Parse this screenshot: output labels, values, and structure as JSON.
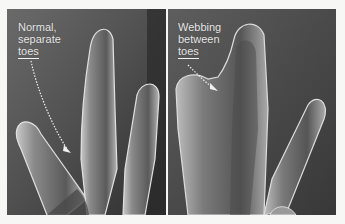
{
  "figure": {
    "panels": [
      {
        "id": "normal",
        "caption_lines": [
          "Normal,",
          "separate",
          "toes"
        ],
        "description": "Four separate digits with no tissue between them"
      },
      {
        "id": "webbed",
        "caption_lines": [
          "Webbing",
          "between",
          "toes"
        ],
        "description": "Digits connected by webbing tissue"
      }
    ],
    "colors": {
      "background": "#f7f7f5",
      "panel_dark": "#3a3a3a",
      "panel_mid": "#5a5a5a",
      "label_text": "#e8e8e8",
      "highlight": "#d8d8d8"
    }
  }
}
